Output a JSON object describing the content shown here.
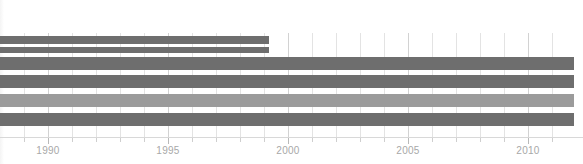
{
  "chart_data": {
    "type": "bar",
    "orientation": "horizontal",
    "title": "",
    "subtitle": "",
    "xlabel": "",
    "ylabel": "",
    "xlim": [
      1988.0,
      2011.9
    ],
    "ylim": [
      0,
      6
    ],
    "grid": true,
    "grid_axis": "x",
    "legend": "none",
    "x_tick_labels": [
      "1990",
      "1995",
      "2000",
      "2005",
      "2010"
    ],
    "x_tick_values": [
      1990,
      1995,
      2000,
      2005,
      2010
    ],
    "x_minor_ticks": [
      1989,
      1991,
      1992,
      1993,
      1994,
      1996,
      1997,
      1998,
      1999,
      2001,
      2002,
      2003,
      2004,
      2006,
      2007,
      2008,
      2009,
      2011
    ],
    "categories": [
      "bar-1",
      "bar-2",
      "bar-3",
      "bar-4",
      "bar-5",
      "bar-6"
    ],
    "series": [
      {
        "name": "timespan",
        "bars": [
          {
            "label": "bar-1",
            "start": 1988.0,
            "end": 1999.2,
            "row_top_px": 36,
            "thickness_px": 8,
            "color": "#6e6e6e"
          },
          {
            "label": "bar-2",
            "start": 1988.0,
            "end": 1999.2,
            "row_top_px": 47,
            "thickness_px": 6,
            "color": "#6e6e6e"
          },
          {
            "label": "bar-3",
            "start": 1988.0,
            "end": 2011.9,
            "row_top_px": 57,
            "thickness_px": 13,
            "color": "#6e6e6e"
          },
          {
            "label": "bar-4",
            "start": 1988.0,
            "end": 2011.9,
            "row_top_px": 75,
            "thickness_px": 13,
            "color": "#6e6e6e"
          },
          {
            "label": "bar-5",
            "start": 1988.0,
            "end": 2011.9,
            "row_top_px": 94,
            "thickness_px": 13,
            "color": "#9b9b9b"
          },
          {
            "label": "bar-6",
            "start": 1988.0,
            "end": 2011.9,
            "row_top_px": 113,
            "thickness_px": 13,
            "color": "#6e6e6e"
          }
        ]
      }
    ],
    "colors": {
      "bar_dark": "#6e6e6e",
      "bar_light": "#9b9b9b",
      "gridline": "#e3e3e3",
      "gridline_major": "#d2d2d2",
      "axis_line": "#d8d8d8",
      "tick": "#cfcfcf",
      "tick_label": "#a8a8a8",
      "background": "#ffffff"
    },
    "geometry": {
      "plot_left_px": 0,
      "plot_right_px": 583,
      "px_per_year": 24,
      "year_1990_px": 48,
      "axis_y_px": 137,
      "grid_top_px": 33,
      "grid_bottom_px": 137
    }
  }
}
